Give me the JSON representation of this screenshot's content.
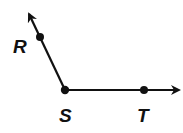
{
  "diagram": {
    "type": "angle",
    "points": [
      {
        "name": "R",
        "label": "R",
        "x": 40,
        "y": 37
      },
      {
        "name": "S",
        "label": "S",
        "x": 65,
        "y": 90
      },
      {
        "name": "T",
        "label": "T",
        "x": 144,
        "y": 90
      }
    ],
    "rays": [
      {
        "from": "S",
        "through": "R"
      },
      {
        "from": "S",
        "through": "T"
      }
    ],
    "vertex": "S",
    "color": "#111111"
  }
}
